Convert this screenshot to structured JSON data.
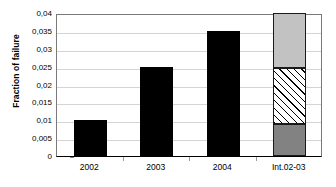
{
  "chart_data": {
    "type": "bar",
    "title": "",
    "subtitle": "",
    "xlabel": "",
    "ylabel": "Fraction of failure",
    "categories": [
      "2002",
      "2003",
      "2004",
      "Int.02-03"
    ],
    "values": [
      0.01,
      0.025,
      0.035,
      0.04
    ],
    "ylim": [
      0,
      0.04
    ],
    "y_ticks": [
      0,
      0.005,
      0.01,
      0.015,
      0.02,
      0.025,
      0.03,
      0.035,
      0.04
    ],
    "y_tick_labels": [
      "0",
      "0,005",
      "0,01",
      "0,015",
      "0,02",
      "0,025",
      "0,03",
      "0,035",
      "0,04"
    ],
    "grid": true,
    "grid_axis": "y",
    "legend": false,
    "legend_position": "none",
    "decimal_separator": ",",
    "series": [
      {
        "name": "Fraction of failure",
        "values": [
          0.01,
          0.025,
          0.035,
          null
        ],
        "fill": "solid-black",
        "color": "#000000"
      }
    ],
    "stacked_bar": {
      "category": "Int.02-03",
      "total": 0.04,
      "segments": [
        {
          "name": "lower-segment",
          "from": 0.0,
          "to": 0.009,
          "value": 0.009,
          "fill": "solid-dark-gray",
          "color": "#828282"
        },
        {
          "name": "middle-segment",
          "from": 0.009,
          "to": 0.0245,
          "value": 0.0155,
          "fill": "diagonal-hatch",
          "color": "#ffffff"
        },
        {
          "name": "upper-segment",
          "from": 0.0245,
          "to": 0.04,
          "value": 0.0155,
          "fill": "solid-light-gray",
          "color": "#c2c2c2"
        }
      ]
    },
    "colors": {
      "bar": "#000000",
      "segment_light": "#c2c2c2",
      "segment_dark": "#828282",
      "segment_hatch_bg": "#ffffff",
      "gridline": "#d4d4d4",
      "axis": "#000000",
      "plot_border": "#7a7a7a",
      "background": "#ffffff",
      "text": "#000000"
    }
  }
}
